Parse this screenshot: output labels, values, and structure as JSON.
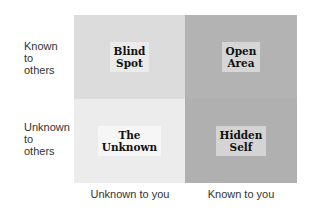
{
  "rows": [
    {
      "label_lines": [
        "Known",
        "to",
        "others"
      ]
    },
    {
      "label_lines": [
        "Unknown",
        "to",
        "others"
      ]
    }
  ],
  "columns": [
    {
      "label": "Unknown to you"
    },
    {
      "label": "Known to you"
    }
  ],
  "quadrants": {
    "top_left": {
      "lines": [
        "Blind",
        "Spot"
      ],
      "color": "#dcdcdc",
      "label_bg": "#ebebeb"
    },
    "top_right": {
      "lines": [
        "Open",
        "Area"
      ],
      "color": "#b3b3b3",
      "label_bg": "#d6d6d6"
    },
    "bottom_left": {
      "lines": [
        "The",
        "Unknown"
      ],
      "color": "#ececec",
      "label_bg": "#f6f6f6"
    },
    "bottom_right": {
      "lines": [
        "Hidden",
        "Self"
      ],
      "color": "#b0b0b0",
      "label_bg": "#d4d4d4"
    }
  }
}
